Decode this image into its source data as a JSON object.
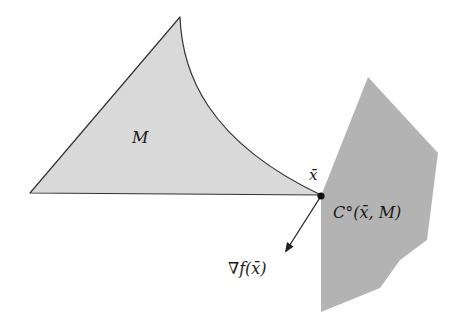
{
  "diagram": {
    "type": "geometric illustration",
    "shapes": {
      "set_m": {
        "label": "M",
        "fill": "#d9d9d9",
        "stroke": "#333333"
      },
      "polar_cone": {
        "label": "C°(x̄, M)",
        "fill": "#b3b3b3"
      },
      "point": {
        "label": "x̄",
        "color": "#111111"
      },
      "gradient_vector": {
        "label": "∇f(x̄)",
        "color": "#222222"
      }
    }
  }
}
